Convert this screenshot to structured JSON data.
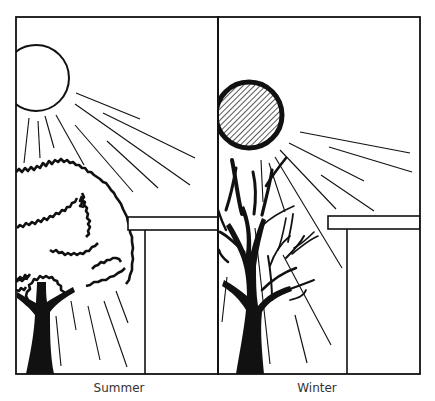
{
  "figure": {
    "type": "diagram",
    "panels": [
      {
        "id": "summer",
        "label": "Summer",
        "sun": {
          "style": "open-circle",
          "elevation": "high"
        },
        "tree": {
          "state": "full-foliage",
          "blocks_sun": true
        },
        "overhang": true
      },
      {
        "id": "winter",
        "label": "Winter",
        "sun": {
          "style": "hatched-circle",
          "elevation": "low"
        },
        "tree": {
          "state": "bare-branches",
          "blocks_sun": false
        },
        "overhang": true
      }
    ],
    "colors": {
      "ink": "#111111",
      "background": "#ffffff",
      "caption": "#333333"
    }
  }
}
